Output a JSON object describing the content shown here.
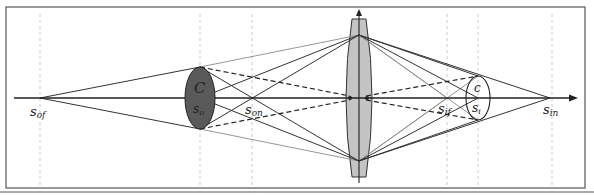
{
  "diagram": {
    "type": "thin-lens optical ray diagram",
    "colors": {
      "frame": "#555555",
      "axis": "#222222",
      "guide": "#bbbbbb",
      "ray_dark": "#333333",
      "ray_gray": "#8a8a8a",
      "object_fill": "#5a5a5a",
      "lens_fill": "#c4c4c4",
      "image_fill": "#ffffff"
    },
    "labels": {
      "s_of": {
        "main": "s",
        "sub": "of"
      },
      "s_o": {
        "main": "s",
        "sub": "o"
      },
      "C": {
        "main": "C"
      },
      "s_on": {
        "main": "s",
        "sub": "on"
      },
      "s_if": {
        "main": "s",
        "sub": "if"
      },
      "c": {
        "main": "c"
      },
      "s_i": {
        "main": "s",
        "sub": "i"
      },
      "s_in": {
        "main": "s",
        "sub": "in"
      }
    },
    "elements": {
      "object_disk": "large dark circle of confusion C at object plane s_o",
      "lens": "biconvex lens with vertical optical axis arrow",
      "image_disk": "small white circle of confusion c at image plane s_i",
      "optical_axis": "horizontal arrow pointing right"
    }
  }
}
